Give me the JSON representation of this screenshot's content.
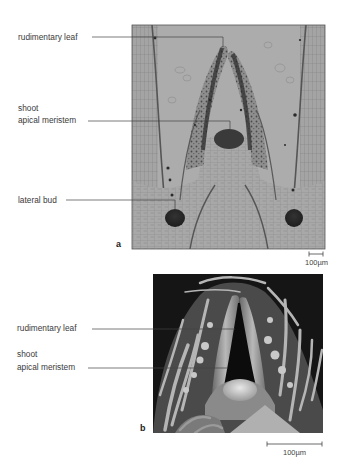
{
  "figure": {
    "panels": [
      {
        "id": "a",
        "letter": "a",
        "type": "light micrograph (longitudinal section of shoot tip)",
        "labels": {
          "rudimentary_leaf": "rudimentary leaf",
          "shoot": "shoot",
          "apical_meristem": "apical meristem",
          "lateral_bud": "lateral bud"
        },
        "scale_bar": "100µm"
      },
      {
        "id": "b",
        "letter": "b",
        "type": "scanning electron micrograph of shoot tip",
        "labels": {
          "rudimentary_leaf": "rudimentary leaf",
          "shoot": "shoot",
          "apical_meristem": "apical meristem"
        },
        "scale_bar": "100µm"
      }
    ],
    "colors": {
      "panel_a_background": "#a9a9a9",
      "panel_b_background": "#1a1a1a",
      "leader_line": "#444444",
      "label_text": "#3a3a3a"
    }
  }
}
